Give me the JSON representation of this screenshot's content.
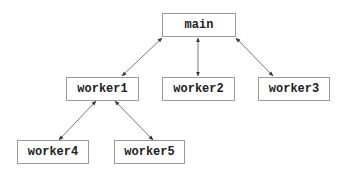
{
  "diagram": {
    "type": "tree",
    "nodes": [
      {
        "id": "main",
        "label": "main"
      },
      {
        "id": "worker1",
        "label": "worker1"
      },
      {
        "id": "worker2",
        "label": "worker2"
      },
      {
        "id": "worker3",
        "label": "worker3"
      },
      {
        "id": "worker4",
        "label": "worker4"
      },
      {
        "id": "worker5",
        "label": "worker5"
      }
    ],
    "edges": [
      {
        "from": "main",
        "to": "worker1",
        "direction": "bidirectional"
      },
      {
        "from": "main",
        "to": "worker2",
        "direction": "bidirectional"
      },
      {
        "from": "main",
        "to": "worker3",
        "direction": "bidirectional"
      },
      {
        "from": "worker1",
        "to": "worker4",
        "direction": "bidirectional"
      },
      {
        "from": "worker1",
        "to": "worker5",
        "direction": "bidirectional"
      }
    ],
    "colors": {
      "border": "#9a9a9a",
      "text": "#222222",
      "edge": "#555555",
      "background": "#ffffff"
    }
  }
}
